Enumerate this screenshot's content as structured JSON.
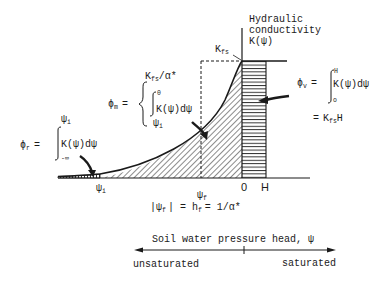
{
  "diagram": {
    "title_label": {
      "line1": "Hydraulic",
      "line2": "conductivity",
      "line3": "K(ψ)"
    },
    "kfs_label": {
      "main": "K",
      "sub": "fs"
    },
    "phi_r": {
      "lhs_main": "ϕ",
      "lhs_sub": "r",
      "eq": "=",
      "upper": "ψ",
      "upper_sub": "i",
      "integrand": "K(ψ)dψ",
      "lower": "-∞"
    },
    "phi_m": {
      "lhs_main": "ϕ",
      "lhs_sub": "m",
      "eq": "=",
      "top_main": "K",
      "top_sub": "fs",
      "top_rest": "/α*",
      "upper": "0",
      "integrand": "K(ψ)dψ",
      "lower": "ψ",
      "lower_sub": "i"
    },
    "phi_v": {
      "lhs_main": "ϕ",
      "lhs_sub": "v",
      "eq": "=",
      "upper": "H",
      "integrand": "K(ψ)dψ",
      "lower": "o",
      "result_eq": "=",
      "result_main": "K",
      "result_sub": "fs",
      "result_rest": "H"
    },
    "x_labels": {
      "psi_i": {
        "main": "ψ",
        "sub": "i"
      },
      "psi_f": {
        "main": "ψ",
        "sub": "f"
      },
      "zero": "0",
      "H": "H"
    },
    "relation": {
      "part1": "|ψ",
      "part1_sub": "f",
      "part2": "| = h",
      "part2_sub": "f",
      "part3": "= 1/α*"
    },
    "axis": {
      "title": "Soil water pressure head, ψ",
      "left_label": "unsaturated",
      "right_label": "saturated"
    },
    "colors": {
      "ink": "#1a1a1a",
      "background": "#ffffff"
    }
  }
}
